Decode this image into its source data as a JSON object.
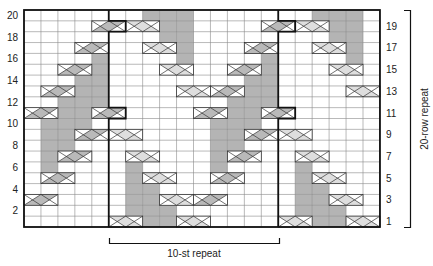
{
  "chart": {
    "columns": 21,
    "rows": 20,
    "left_row_labels": [
      "20",
      "18",
      "16",
      "14",
      "12",
      "10",
      "8",
      "6",
      "4",
      "2"
    ],
    "left_row_label_rows": [
      20,
      18,
      16,
      14,
      12,
      10,
      8,
      6,
      4,
      2
    ],
    "right_row_labels": [
      "19",
      "17",
      "15",
      "13",
      "11",
      "9",
      "7",
      "5",
      "3",
      "1"
    ],
    "right_row_label_rows": [
      19,
      17,
      15,
      13,
      11,
      9,
      7,
      5,
      3,
      1
    ],
    "stitch_repeat_label": "10-st repeat",
    "row_repeat_label": "20-row repeat",
    "stitch_repeat_columns": [
      5,
      14
    ],
    "colors": {
      "grid_line": "#8a8a8a",
      "border": "#111111",
      "purl_gray": "#b4b4b4",
      "cable_dark": "#b9b9b9",
      "cable_light": "#dedede",
      "cable_stroke": "#333333",
      "background": "#ffffff"
    },
    "legend_note": "Gray cells = shaded stitches; boxed X cells = cable crosses (dark = left cross, light = right cross)"
  },
  "chart_data": {
    "type": "table",
    "xlabel": "10-st repeat",
    "ylabel": "20-row repeat",
    "gray_cells": {
      "20": [
        7,
        8,
        9,
        17,
        18,
        19
      ],
      "19": [
        8,
        9,
        18,
        19
      ],
      "18": [
        8,
        9,
        18,
        19
      ],
      "17": [
        9,
        19
      ],
      "16": [
        4,
        9,
        14,
        19
      ],
      "15": [
        4,
        14
      ],
      "14": [
        3,
        4,
        13,
        14
      ],
      "13": [
        3,
        4,
        13,
        14
      ],
      "12": [
        2,
        3,
        4,
        12,
        13,
        14
      ],
      "11": [
        2,
        3,
        12,
        13
      ],
      "10": [
        1,
        2,
        3,
        11,
        12,
        13
      ],
      "9": [
        1,
        2,
        11,
        12
      ],
      "8": [
        1,
        2,
        11,
        12
      ],
      "7": [
        1,
        11
      ],
      "6": [
        1,
        6,
        11,
        16
      ],
      "5": [
        6,
        16
      ],
      "4": [
        6,
        7,
        16,
        17
      ],
      "3": [
        6,
        7,
        16,
        17
      ],
      "2": [
        6,
        7,
        8,
        16,
        17,
        18
      ],
      "1": [
        7,
        8,
        17,
        18
      ]
    },
    "cables": [
      {
        "row": 19,
        "start": 4,
        "type": "dark"
      },
      {
        "row": 19,
        "start": 6,
        "type": "light"
      },
      {
        "row": 19,
        "start": 14,
        "type": "dark"
      },
      {
        "row": 19,
        "start": 16,
        "type": "light"
      },
      {
        "row": 17,
        "start": 3,
        "type": "dark"
      },
      {
        "row": 17,
        "start": 7,
        "type": "light"
      },
      {
        "row": 17,
        "start": 13,
        "type": "dark"
      },
      {
        "row": 17,
        "start": 17,
        "type": "light"
      },
      {
        "row": 15,
        "start": 2,
        "type": "dark"
      },
      {
        "row": 15,
        "start": 8,
        "type": "light"
      },
      {
        "row": 15,
        "start": 12,
        "type": "dark"
      },
      {
        "row": 15,
        "start": 18,
        "type": "light"
      },
      {
        "row": 13,
        "start": 1,
        "type": "dark"
      },
      {
        "row": 13,
        "start": 9,
        "type": "light"
      },
      {
        "row": 13,
        "start": 11,
        "type": "dark"
      },
      {
        "row": 13,
        "start": 19,
        "type": "light"
      },
      {
        "row": 11,
        "start": 0,
        "type": "dark"
      },
      {
        "row": 11,
        "start": 4,
        "type": "dark"
      },
      {
        "row": 11,
        "start": 10,
        "type": "dark"
      },
      {
        "row": 11,
        "start": 14,
        "type": "dark"
      },
      {
        "row": 9,
        "start": 3,
        "type": "dark"
      },
      {
        "row": 9,
        "start": 5,
        "type": "light"
      },
      {
        "row": 9,
        "start": 13,
        "type": "dark"
      },
      {
        "row": 9,
        "start": 15,
        "type": "light"
      },
      {
        "row": 7,
        "start": 2,
        "type": "dark"
      },
      {
        "row": 7,
        "start": 6,
        "type": "light"
      },
      {
        "row": 7,
        "start": 12,
        "type": "dark"
      },
      {
        "row": 7,
        "start": 16,
        "type": "light"
      },
      {
        "row": 5,
        "start": 1,
        "type": "dark"
      },
      {
        "row": 5,
        "start": 7,
        "type": "light"
      },
      {
        "row": 5,
        "start": 11,
        "type": "dark"
      },
      {
        "row": 5,
        "start": 17,
        "type": "light"
      },
      {
        "row": 3,
        "start": 0,
        "type": "dark"
      },
      {
        "row": 3,
        "start": 8,
        "type": "light"
      },
      {
        "row": 3,
        "start": 10,
        "type": "dark"
      },
      {
        "row": 3,
        "start": 18,
        "type": "light"
      },
      {
        "row": 1,
        "start": 5,
        "type": "light"
      },
      {
        "row": 1,
        "start": 9,
        "type": "light"
      },
      {
        "row": 1,
        "start": 15,
        "type": "light"
      },
      {
        "row": 1,
        "start": 19,
        "type": "light"
      }
    ]
  }
}
